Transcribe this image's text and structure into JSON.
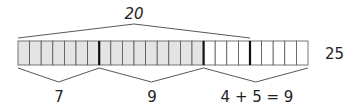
{
  "diagram": {
    "total_cells": 25,
    "shaded_cells": 16,
    "bold_dividers_after": [
      7,
      16,
      20
    ],
    "colors": {
      "shaded": "#e4e4e4",
      "unshaded": "#ffffff",
      "line": "#555555",
      "bold": "#111111"
    },
    "top_label": "20",
    "right_label": "25",
    "bottom_labels": [
      "7",
      "9",
      "4 + 5 = 9"
    ]
  }
}
